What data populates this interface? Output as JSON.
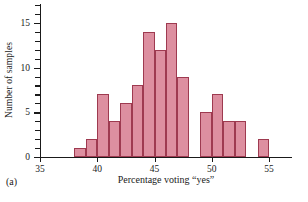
{
  "figure": {
    "panel_label": "(a)"
  },
  "chart_data": {
    "type": "bar",
    "title": "",
    "subtitle": "",
    "xlabel": "Percentage voting “yes”",
    "ylabel": "Number of samples",
    "xlim": [
      35,
      57
    ],
    "ylim": [
      0,
      17
    ],
    "grid": false,
    "legend": null,
    "bin_width": 1,
    "x_ticks": [
      35,
      40,
      45,
      50,
      55
    ],
    "x_tick_labels": [
      "35",
      "40",
      "45",
      "50",
      "55"
    ],
    "y_ticks": [
      0,
      5,
      10,
      15
    ],
    "y_tick_labels": [
      "0",
      "5",
      "10",
      "15"
    ],
    "y_minor_ticks": [
      1,
      2,
      3,
      4,
      6,
      7,
      8,
      9,
      11,
      12,
      13,
      14,
      16,
      17
    ],
    "categories": [
      "38-39",
      "39-40",
      "40-41",
      "41-42",
      "42-43",
      "43-44",
      "44-45",
      "45-46",
      "46-47",
      "47-48",
      "48-49",
      "49-50",
      "50-51",
      "51-52",
      "52-53",
      "53-54",
      "54-55"
    ],
    "bin_starts": [
      38,
      39,
      40,
      41,
      42,
      43,
      44,
      45,
      46,
      47,
      48,
      49,
      50,
      51,
      52,
      53,
      54
    ],
    "values": [
      1,
      2,
      7,
      4,
      6,
      8,
      14,
      12,
      15,
      9,
      0,
      5,
      7,
      4,
      4,
      0,
      2
    ],
    "bar_fill_color": "#dd8fa0",
    "bar_edge_color": "#9e3a50",
    "axis_color": "#1a1a1a"
  }
}
